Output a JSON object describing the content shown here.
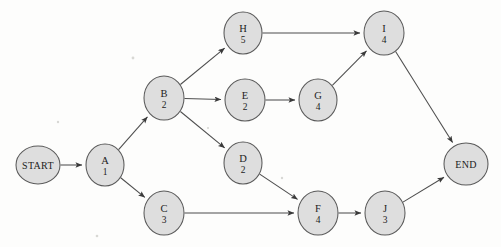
{
  "page": {
    "background_color": "#fdfdfc",
    "width": 501,
    "height": 247,
    "top_strip_text": "上方裁切文字 — 截断的中文标题行",
    "node_fill": "#dedede",
    "node_stroke": "#5a5a5a",
    "edge_color": "#4d4d4d"
  },
  "diagram": {
    "type": "activity-on-node network",
    "nodes": [
      {
        "id": "START",
        "letter": "START",
        "duration": "",
        "terminal": true,
        "cx": 38,
        "cy": 165,
        "rx": 22,
        "ry": 19
      },
      {
        "id": "A",
        "letter": "A",
        "duration": "1",
        "terminal": false,
        "cx": 105,
        "cy": 165,
        "rx": 19,
        "ry": 21
      },
      {
        "id": "B",
        "letter": "B",
        "duration": "2",
        "terminal": false,
        "cx": 164,
        "cy": 98,
        "rx": 20,
        "ry": 22
      },
      {
        "id": "C",
        "letter": "C",
        "duration": "3",
        "terminal": false,
        "cx": 164,
        "cy": 213,
        "rx": 20,
        "ry": 22
      },
      {
        "id": "D",
        "letter": "D",
        "duration": "2",
        "terminal": false,
        "cx": 243,
        "cy": 163,
        "rx": 19,
        "ry": 21
      },
      {
        "id": "E",
        "letter": "E",
        "duration": "2",
        "terminal": false,
        "cx": 245,
        "cy": 100,
        "rx": 20,
        "ry": 21
      },
      {
        "id": "F",
        "letter": "F",
        "duration": "4",
        "terminal": false,
        "cx": 318,
        "cy": 213,
        "rx": 20,
        "ry": 22
      },
      {
        "id": "G",
        "letter": "G",
        "duration": "4",
        "terminal": false,
        "cx": 318,
        "cy": 100,
        "rx": 19,
        "ry": 21
      },
      {
        "id": "H",
        "letter": "H",
        "duration": "5",
        "terminal": false,
        "cx": 243,
        "cy": 33,
        "rx": 19,
        "ry": 21
      },
      {
        "id": "I",
        "letter": "I",
        "duration": "4",
        "terminal": false,
        "cx": 384,
        "cy": 33,
        "rx": 20,
        "ry": 22
      },
      {
        "id": "J",
        "letter": "J",
        "duration": "3",
        "terminal": false,
        "cx": 385,
        "cy": 213,
        "rx": 20,
        "ry": 22
      },
      {
        "id": "END",
        "letter": "END",
        "duration": "",
        "terminal": true,
        "cx": 466,
        "cy": 164,
        "rx": 22,
        "ry": 21
      }
    ],
    "edges": [
      {
        "from": "START",
        "to": "A"
      },
      {
        "from": "A",
        "to": "B"
      },
      {
        "from": "A",
        "to": "C"
      },
      {
        "from": "B",
        "to": "H"
      },
      {
        "from": "B",
        "to": "E"
      },
      {
        "from": "B",
        "to": "D"
      },
      {
        "from": "C",
        "to": "F"
      },
      {
        "from": "D",
        "to": "F"
      },
      {
        "from": "E",
        "to": "G"
      },
      {
        "from": "G",
        "to": "I"
      },
      {
        "from": "H",
        "to": "I"
      },
      {
        "from": "F",
        "to": "J"
      },
      {
        "from": "I",
        "to": "END"
      },
      {
        "from": "J",
        "to": "END"
      }
    ],
    "specks": [
      {
        "cx": 133,
        "cy": 58,
        "r": 1.4
      },
      {
        "cx": 97,
        "cy": 236,
        "r": 1.3
      },
      {
        "cx": 282,
        "cy": 178,
        "r": 1.2
      },
      {
        "cx": 208,
        "cy": 128,
        "r": 1.1
      },
      {
        "cx": 58,
        "cy": 122,
        "r": 1.2
      }
    ]
  }
}
